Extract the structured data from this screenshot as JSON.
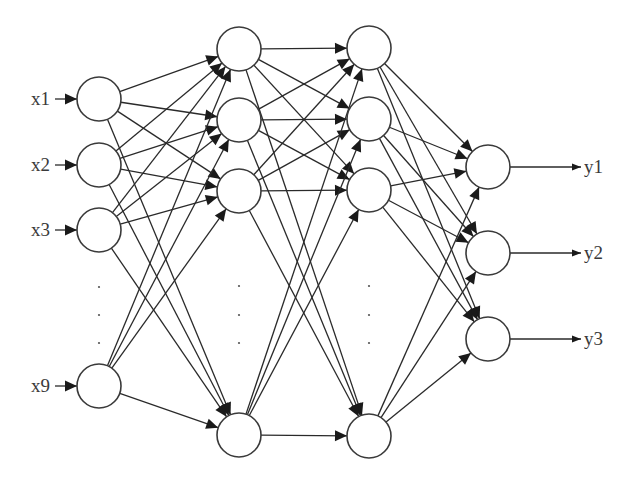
{
  "diagram": {
    "colors": {
      "stroke": "#2a2a2a",
      "node_fill": "#ffffff",
      "text": "#3a3a3a"
    },
    "node_radius": 22,
    "layers": [
      {
        "name": "input",
        "nodes": [
          {
            "id": "x1",
            "cx": 99,
            "cy": 99
          },
          {
            "id": "x2",
            "cx": 99,
            "cy": 165
          },
          {
            "id": "x3",
            "cx": 99,
            "cy": 230
          },
          {
            "id": "x9",
            "cx": 99,
            "cy": 386
          }
        ],
        "ellipsis": {
          "x": 99,
          "ys": [
            287,
            315,
            343
          ]
        }
      },
      {
        "name": "hidden1",
        "nodes": [
          {
            "id": "h1_1",
            "cx": 239,
            "cy": 49
          },
          {
            "id": "h1_2",
            "cx": 239,
            "cy": 120
          },
          {
            "id": "h1_3",
            "cx": 239,
            "cy": 191
          },
          {
            "id": "h1_n",
            "cx": 239,
            "cy": 435
          }
        ],
        "ellipsis": {
          "x": 239,
          "ys": [
            286,
            315,
            343
          ]
        }
      },
      {
        "name": "hidden2",
        "nodes": [
          {
            "id": "h2_1",
            "cx": 369,
            "cy": 48
          },
          {
            "id": "h2_2",
            "cx": 369,
            "cy": 119
          },
          {
            "id": "h2_3",
            "cx": 369,
            "cy": 190
          },
          {
            "id": "h2_n",
            "cx": 369,
            "cy": 436
          }
        ],
        "ellipsis": {
          "x": 369,
          "ys": [
            286,
            315,
            343
          ]
        }
      },
      {
        "name": "output",
        "nodes": [
          {
            "id": "y1",
            "cx": 488,
            "cy": 167
          },
          {
            "id": "y2",
            "cx": 488,
            "cy": 253
          },
          {
            "id": "y3",
            "cx": 488,
            "cy": 339
          }
        ]
      }
    ],
    "inputs": [
      {
        "label": "x1",
        "y": 99
      },
      {
        "label": "x2",
        "y": 165
      },
      {
        "label": "x3",
        "y": 230
      },
      {
        "label": "x9",
        "y": 386
      }
    ],
    "outputs": [
      {
        "label": "y1",
        "y": 167
      },
      {
        "label": "y2",
        "y": 253
      },
      {
        "label": "y3",
        "y": 339
      }
    ]
  }
}
